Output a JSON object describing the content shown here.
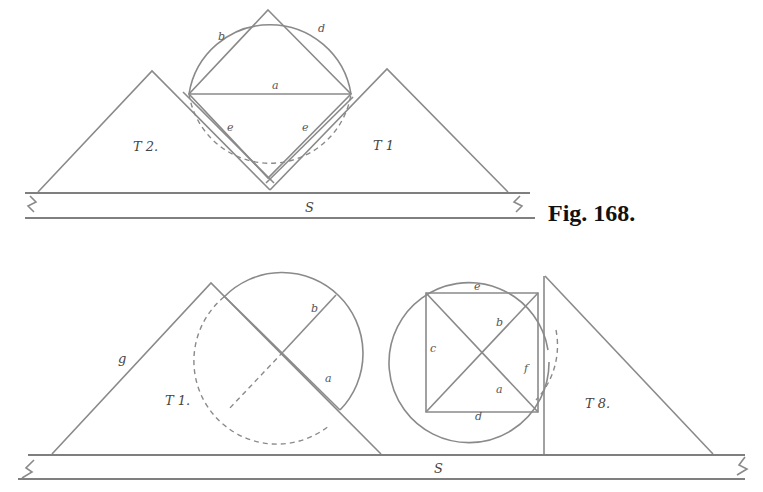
{
  "figure": {
    "caption": "Fig. 168.",
    "top": {
      "straightedge_label": "S",
      "triangle_left_label": "T 2.",
      "triangle_right_label": "T 1",
      "labels": {
        "b": "b",
        "d": "d",
        "a": "a",
        "e_left": "e",
        "e_right": "e"
      }
    },
    "bottom": {
      "straightedge_label": "S",
      "triangle_left_label": "T 1.",
      "triangle_left_side_label": "g",
      "triangle_right_label": "T 8.",
      "left_circle_labels": {
        "b": "b",
        "a": "a"
      },
      "right_circle_labels": {
        "e_top": "e",
        "b": "b",
        "c": "c",
        "f": "f",
        "a": "a",
        "d": "d"
      }
    }
  }
}
